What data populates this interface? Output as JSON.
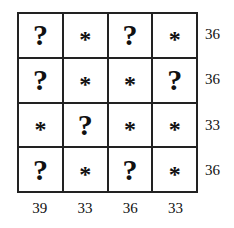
{
  "puzzle": {
    "grid": [
      [
        "?",
        "*",
        "?",
        "*"
      ],
      [
        "?",
        "*",
        "*",
        "?"
      ],
      [
        "*",
        "?",
        "*",
        "*"
      ],
      [
        "?",
        "*",
        "?",
        "*"
      ]
    ],
    "row_sums": [
      "36",
      "36",
      "33",
      "36"
    ],
    "col_sums": [
      "39",
      "33",
      "36",
      "33"
    ]
  }
}
